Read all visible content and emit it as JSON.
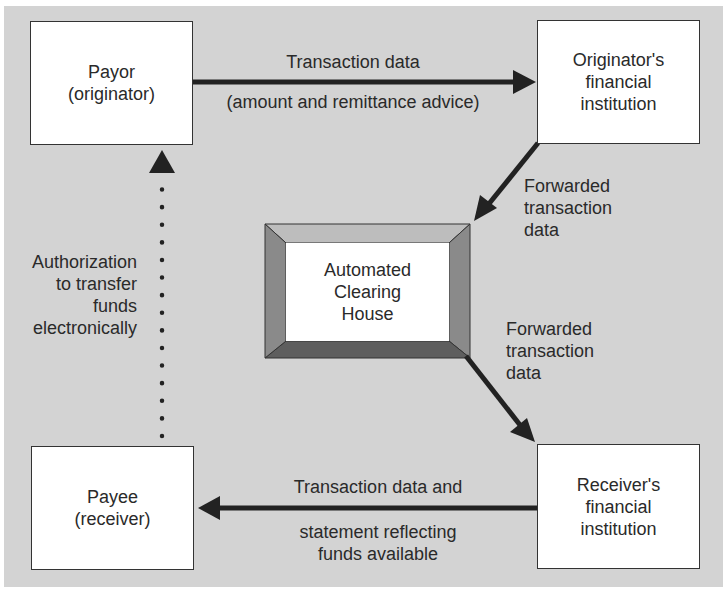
{
  "diagram": {
    "title": "",
    "colors": {
      "background": "#d3d3d3",
      "box_fill": "#ffffff",
      "arrow": "#222222",
      "bevel_light": "#bdbdbd",
      "bevel_mid": "#8a8a8a",
      "bevel_dark": "#5e5e5e"
    },
    "nodes": {
      "payor": {
        "line1": "Payor",
        "line2": "(originator)"
      },
      "originator_fi": {
        "line1": "Originator's",
        "line2": "financial",
        "line3": "institution"
      },
      "ach": {
        "line1": "Automated",
        "line2": "Clearing",
        "line3": "House"
      },
      "receiver_fi": {
        "line1": "Receiver's",
        "line2": "financial",
        "line3": "institution"
      },
      "payee": {
        "line1": "Payee",
        "line2": "(receiver)"
      }
    },
    "edges": {
      "payor_to_ofi": {
        "line1": "Transaction data",
        "line2": "(amount and remittance advice)"
      },
      "ofi_to_ach": {
        "line1": "Forwarded",
        "line2": "transaction",
        "line3": "data"
      },
      "ach_to_rfi": {
        "line1": "Forwarded",
        "line2": "transaction",
        "line3": "data"
      },
      "rfi_to_payee": {
        "line1": "Transaction data and",
        "line2": "statement reflecting",
        "line3": "funds available"
      },
      "payee_to_payor": {
        "line1": "Authorization",
        "line2": "to transfer",
        "line3": "funds",
        "line4": "electronically",
        "style": "dotted"
      }
    }
  }
}
